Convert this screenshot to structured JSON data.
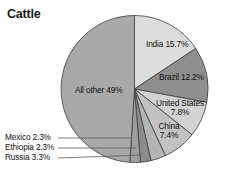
{
  "title": "Cattle",
  "chart_data": {
    "type": "pie",
    "title": "Cattle",
    "xlabel": "",
    "ylabel": "",
    "legend": "none",
    "grid": false,
    "unit": "%",
    "start_angle_deg": 0,
    "direction": "clockwise",
    "categories": [
      "India",
      "Brazil",
      "United States",
      "China",
      "Russia",
      "Ethiopia",
      "Mexico",
      "All other"
    ],
    "values": [
      15.7,
      12.2,
      7.8,
      7.4,
      3.3,
      2.3,
      2.3,
      49.0
    ],
    "slices": [
      {
        "name": "India",
        "value": 15.7,
        "label": "India 15.7%",
        "color": "#dcdcdc",
        "label_style": "inside",
        "label_lines": [
          "India 15.7%"
        ]
      },
      {
        "name": "Brazil",
        "value": 12.2,
        "label": "Brazil 12.2%",
        "color": "#8f8f8f",
        "label_style": "inside",
        "label_lines": [
          "Brazil 12.2%"
        ]
      },
      {
        "name": "United States",
        "value": 7.8,
        "label": "United States 7.8%",
        "color": "#d2d2d2",
        "label_style": "inside",
        "label_lines": [
          "United States",
          "7.8%"
        ]
      },
      {
        "name": "China",
        "value": 7.4,
        "label": "China 7.4%",
        "color": "#c2c2c2",
        "label_style": "inside",
        "label_lines": [
          "China",
          "7.4%"
        ]
      },
      {
        "name": "Russia",
        "value": 3.3,
        "label": "Russia 3.3%",
        "color": "#b4b4b4",
        "label_style": "callout",
        "label_lines": [
          "Russia 3.3%"
        ]
      },
      {
        "name": "Ethiopia",
        "value": 2.3,
        "label": "Ethiopia 2.3%",
        "color": "#8c8c8c",
        "label_style": "callout",
        "label_lines": [
          "Ethiopia 2.3%"
        ]
      },
      {
        "name": "Mexico",
        "value": 2.3,
        "label": "Mexico 2.3%",
        "color": "#9e9e9e",
        "label_style": "callout",
        "label_lines": [
          "Mexico 2.3%"
        ]
      },
      {
        "name": "All other",
        "value": 49.0,
        "label": "All other 49%",
        "color": "#a8a8a8",
        "label_style": "inside",
        "label_lines": [
          "All other 49%"
        ]
      }
    ]
  },
  "labels": {
    "india": "India 15.7%",
    "brazil": "Brazil 12.2%",
    "united_states_line1": "United States",
    "united_states_line2": "7.8%",
    "china_line1": "China",
    "china_line2": "7.4%",
    "all_other": "All other 49%",
    "mexico": "Mexico 2.3%",
    "ethiopia": "Ethiopia 2.3%",
    "russia": "Russia 3.3%"
  },
  "colors": {
    "background": "#ffffff",
    "outline": "#3c3c3c",
    "text": "#111111",
    "title": "#1c1c1c",
    "leader_line": "#5a5a5a"
  }
}
